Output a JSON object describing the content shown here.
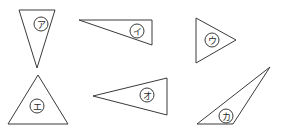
{
  "diagram": {
    "title": "",
    "stroke_color": "#3a3a3a",
    "background": "#ffffff",
    "triangles": [
      {
        "id": "a",
        "label": "ア",
        "points": [
          [
            19,
            10
          ],
          [
            55,
            10
          ],
          [
            37,
            68
          ]
        ],
        "label_center": [
          41,
          24
        ]
      },
      {
        "id": "i",
        "label": "イ",
        "points": [
          [
            79,
            20
          ],
          [
            152,
            20
          ],
          [
            152,
            45
          ]
        ],
        "label_center": [
          137,
          31
        ]
      },
      {
        "id": "u",
        "label": "ウ",
        "points": [
          [
            196,
            18
          ],
          [
            196,
            63
          ],
          [
            236,
            40
          ]
        ],
        "label_center": [
          212,
          40
        ]
      },
      {
        "id": "e",
        "label": "エ",
        "points": [
          [
            38,
            75
          ],
          [
            8,
            124
          ],
          [
            68,
            124
          ]
        ],
        "label_center": [
          37,
          106
        ]
      },
      {
        "id": "o",
        "label": "オ",
        "points": [
          [
            93,
            96
          ],
          [
            167,
            78
          ],
          [
            167,
            115
          ]
        ],
        "label_center": [
          147,
          95
        ]
      },
      {
        "id": "ka",
        "label": "カ",
        "points": [
          [
            270,
            67
          ],
          [
            197,
            124
          ],
          [
            233,
            124
          ]
        ],
        "label_center": [
          226,
          116
        ]
      }
    ],
    "label_radius": 7
  }
}
